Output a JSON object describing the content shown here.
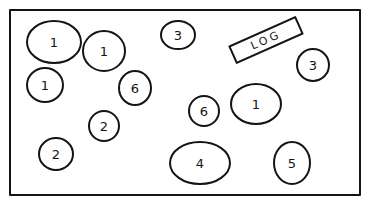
{
  "diagram": {
    "frame": {
      "x": 10,
      "y": 10,
      "width": 350,
      "height": 185
    },
    "log_box": {
      "label": "LOG",
      "cx": 266,
      "cy": 40,
      "width": 72,
      "height": 18,
      "rotation": -24
    },
    "circles": [
      {
        "id": "c1",
        "label": "1",
        "cx": 54,
        "cy": 42,
        "rx": 27,
        "ry": 21
      },
      {
        "id": "c2",
        "label": "1",
        "cx": 104,
        "cy": 51,
        "rx": 21,
        "ry": 20
      },
      {
        "id": "c3",
        "label": "3",
        "cx": 178,
        "cy": 35,
        "rx": 17,
        "ry": 14
      },
      {
        "id": "c4",
        "label": "3",
        "cx": 313,
        "cy": 65,
        "rx": 16,
        "ry": 16
      },
      {
        "id": "c5",
        "label": "1",
        "cx": 45,
        "cy": 85,
        "rx": 18,
        "ry": 17
      },
      {
        "id": "c6",
        "label": "6",
        "cx": 135,
        "cy": 88,
        "rx": 16,
        "ry": 17
      },
      {
        "id": "c7",
        "label": "6",
        "cx": 204,
        "cy": 111,
        "rx": 15,
        "ry": 15
      },
      {
        "id": "c8",
        "label": "1",
        "cx": 256,
        "cy": 104,
        "rx": 25,
        "ry": 20
      },
      {
        "id": "c9",
        "label": "2",
        "cx": 104,
        "cy": 126,
        "rx": 15,
        "ry": 15
      },
      {
        "id": "c10",
        "label": "2",
        "cx": 56,
        "cy": 154,
        "rx": 17,
        "ry": 16
      },
      {
        "id": "c11",
        "label": "4",
        "cx": 200,
        "cy": 163,
        "rx": 30,
        "ry": 21
      },
      {
        "id": "c12",
        "label": "5",
        "cx": 292,
        "cy": 163,
        "rx": 18,
        "ry": 21
      }
    ]
  }
}
